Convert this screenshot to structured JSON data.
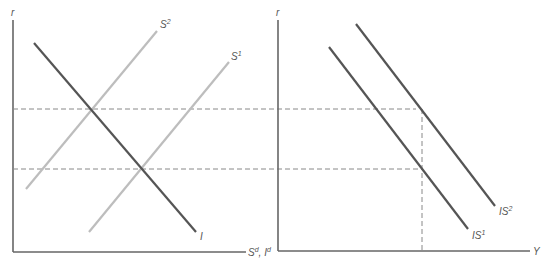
{
  "diagram": {
    "left_panel": {
      "y_axis_label": "r",
      "x_axis_label": "S",
      "x_axis_label_sup": "d",
      "x_axis_label_sep": ", ",
      "x_axis_label2": "I",
      "x_axis_label2_sup": "d",
      "curves": [
        {
          "name": "I",
          "label": "I",
          "sup": "",
          "color": "#555555"
        },
        {
          "name": "S2",
          "label": "S",
          "sup": "2",
          "color": "#bdbdbd"
        },
        {
          "name": "S1",
          "label": "S",
          "sup": "1",
          "color": "#bdbdbd"
        }
      ]
    },
    "right_panel": {
      "y_axis_label": "r",
      "x_axis_label": "Y",
      "curves": [
        {
          "name": "IS1",
          "label": "IS",
          "sup": "1",
          "color": "#555555"
        },
        {
          "name": "IS2",
          "label": "IS",
          "sup": "2",
          "color": "#555555"
        }
      ]
    },
    "guides": {
      "upper_r_dashed": "r at S2 = I intersection",
      "lower_r_dashed": "r at S1 = I intersection",
      "color": "#888888"
    },
    "colors": {
      "axis": "#666666",
      "dark_curve": "#555555",
      "light_curve": "#bdbdbd",
      "dash": "#888888"
    }
  }
}
